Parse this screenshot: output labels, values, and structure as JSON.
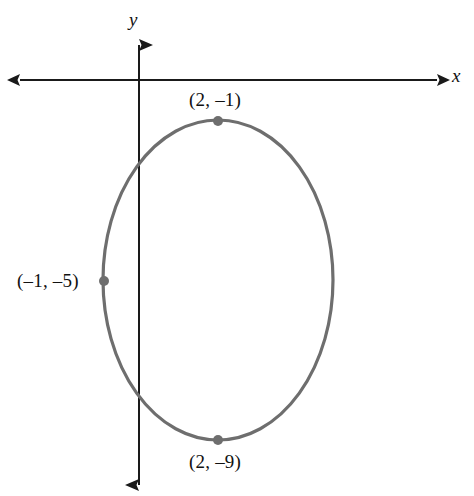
{
  "figure": {
    "width": 474,
    "height": 496,
    "background": "#ffffff"
  },
  "axes": {
    "x_label": "x",
    "y_label": "y",
    "origin": {
      "x": 139,
      "y": 80
    },
    "x_axis": {
      "from_x": 20,
      "to_x": 437,
      "y": 80,
      "arrows": "both"
    },
    "y_axis": {
      "x": 139,
      "from_y": 45,
      "to_y": 485,
      "arrows": "both"
    },
    "axis_color": "#1a1a1a",
    "axis_width": 2
  },
  "curve": {
    "type": "ellipse",
    "center": {
      "x": 218,
      "y": 280
    },
    "rx": 115,
    "ry": 160,
    "color": "#6e6e6e",
    "stroke_width": 3.2
  },
  "points": [
    {
      "name": "top-vertex",
      "label": "(2, –1)",
      "cx": 218,
      "cy": 121
    },
    {
      "name": "bottom-vertex",
      "label": "(2, –9)",
      "cx": 218,
      "cy": 440
    },
    {
      "name": "left-vertex",
      "label": "(–1, –5)",
      "cx": 104,
      "cy": 281
    }
  ],
  "point_marker": {
    "radius": 5,
    "color": "#6e6e6e"
  }
}
